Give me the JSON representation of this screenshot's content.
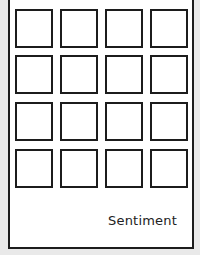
{
  "card": {
    "label": "Sentiment",
    "grid": {
      "rows": 4,
      "cols": 4,
      "tiles": [
        {
          "row": 1,
          "col": 1
        },
        {
          "row": 1,
          "col": 2
        },
        {
          "row": 1,
          "col": 3
        },
        {
          "row": 1,
          "col": 4
        },
        {
          "row": 2,
          "col": 1
        },
        {
          "row": 2,
          "col": 2
        },
        {
          "row": 2,
          "col": 3
        },
        {
          "row": 2,
          "col": 4
        },
        {
          "row": 3,
          "col": 1
        },
        {
          "row": 3,
          "col": 2
        },
        {
          "row": 3,
          "col": 3
        },
        {
          "row": 3,
          "col": 4
        },
        {
          "row": 4,
          "col": 1
        },
        {
          "row": 4,
          "col": 2
        },
        {
          "row": 4,
          "col": 3
        },
        {
          "row": 4,
          "col": 4
        }
      ]
    },
    "colors": {
      "border": "#1c1c1c",
      "background": "#ffffff",
      "page": "#e9e9e9"
    }
  }
}
